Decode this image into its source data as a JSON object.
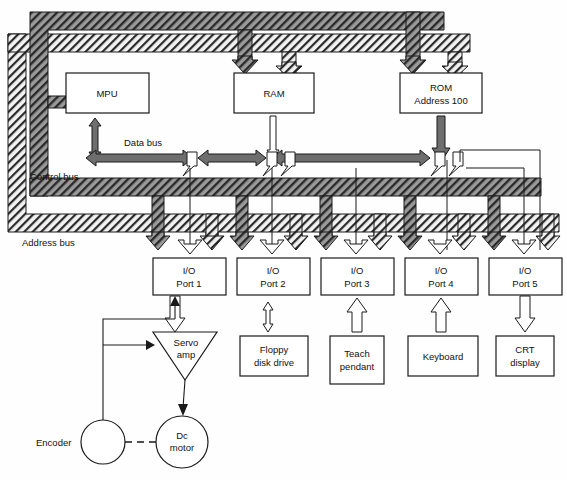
{
  "diagram": {
    "colors": {
      "control_bus_fill": "#8c8c8c",
      "address_bus_fill": "#e8e8e8",
      "data_bus_fill": "#6e6e6e",
      "data_bus_branch_fill": "#ffffff",
      "stroke": "#1a1a1a",
      "background": "#fefefe"
    },
    "bus_labels": [
      {
        "id": "data-bus",
        "text": "Data bus",
        "x": 124,
        "y": 146
      },
      {
        "id": "control-bus",
        "text": "Control bus",
        "x": 30,
        "y": 180
      },
      {
        "id": "address-bus",
        "text": "Address bus",
        "x": 22,
        "y": 242
      }
    ],
    "processor_blocks": [
      {
        "id": "mpu",
        "line1": "MPU",
        "line2": "",
        "x": 66,
        "y": 73,
        "w": 83,
        "h": 40
      },
      {
        "id": "ram",
        "line1": "RAM",
        "line2": "",
        "x": 234,
        "y": 73,
        "w": 80,
        "h": 40
      },
      {
        "id": "rom",
        "line1": "ROM",
        "line2": "Address 100",
        "x": 400,
        "y": 73,
        "w": 82,
        "h": 40
      }
    ],
    "io_ports": [
      {
        "id": "io-port-1",
        "line1": "I/O",
        "line2": "Port 1",
        "x": 153,
        "y": 258,
        "w": 73,
        "h": 37
      },
      {
        "id": "io-port-2",
        "line1": "I/O",
        "line2": "Port 2",
        "x": 237,
        "y": 258,
        "w": 73,
        "h": 37
      },
      {
        "id": "io-port-3",
        "line1": "I/O",
        "line2": "Port 3",
        "x": 321,
        "y": 258,
        "w": 73,
        "h": 37
      },
      {
        "id": "io-port-4",
        "line1": "I/O",
        "line2": "Port 4",
        "x": 405,
        "y": 258,
        "w": 73,
        "h": 37
      },
      {
        "id": "io-port-5",
        "line1": "I/O",
        "line2": "Port 5",
        "x": 489,
        "y": 258,
        "w": 73,
        "h": 37
      }
    ],
    "peripherals": [
      {
        "id": "floppy-disk-drive",
        "line1": "Floppy",
        "line2": "disk drive",
        "x": 240,
        "y": 336,
        "w": 68,
        "h": 40
      },
      {
        "id": "teach-pendant",
        "line1": "Teach",
        "line2": "pendant",
        "x": 330,
        "y": 336,
        "w": 54,
        "h": 48
      },
      {
        "id": "keyboard",
        "line1": "Keyboard",
        "line2": "",
        "x": 408,
        "y": 336,
        "w": 70,
        "h": 40
      },
      {
        "id": "crt-display",
        "line1": "CRT",
        "line2": "display",
        "x": 496,
        "y": 336,
        "w": 58,
        "h": 40
      }
    ],
    "servo": {
      "amp_line1": "Servo",
      "amp_line2": "amp",
      "amp_cx": 185,
      "amp_cy": 342,
      "amp_half_w": 32,
      "amp_h": 46,
      "motor_line1": "Dc",
      "motor_line2": "motor",
      "motor_cx": 182,
      "motor_cy": 442,
      "motor_r": 26,
      "encoder_label": "Encoder",
      "encoder_label_x": 36,
      "encoder_label_y": 444,
      "encoder_cx": 103,
      "encoder_cy": 442,
      "encoder_r": 22
    }
  }
}
